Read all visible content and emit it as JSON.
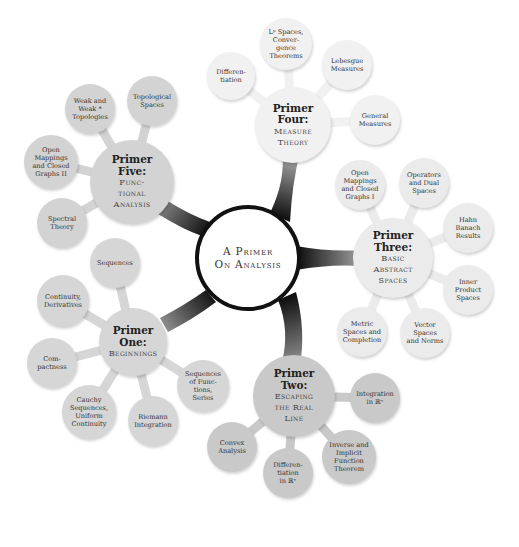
{
  "center": {
    "lines": [
      "A Primer",
      "On Analysis"
    ]
  },
  "primers": [
    {
      "id": "four",
      "title_lines": [
        "Primer",
        "Four:"
      ],
      "subtitle_lines": [
        "Measure",
        "Theory"
      ],
      "color": "#f1f1f1",
      "leaves": [
        {
          "lines": [
            "Differen-",
            "tiation"
          ]
        },
        {
          "lines": [
            "Lᵖ Spaces,",
            "Conver-",
            "gence",
            "Theorems"
          ]
        },
        {
          "lines": [
            "Lebesgue",
            "Measures"
          ]
        },
        {
          "lines": [
            "General",
            "Measures"
          ]
        }
      ]
    },
    {
      "id": "three",
      "title_lines": [
        "Primer",
        "Three:"
      ],
      "subtitle_lines": [
        "Basic",
        "Abstract",
        "Spaces"
      ],
      "color": "#ebebeb",
      "leaves": [
        {
          "lines": [
            "Open",
            "Mappings",
            "and Closed",
            "Graphs I"
          ]
        },
        {
          "lines": [
            "Operators",
            "and Dual",
            "Spaces"
          ]
        },
        {
          "lines": [
            "Hahn",
            "Banach",
            "Results"
          ]
        },
        {
          "lines": [
            "Inner",
            "Product",
            "Spaces"
          ]
        },
        {
          "lines": [
            "Vector",
            "Spaces",
            "and Norms"
          ]
        },
        {
          "lines": [
            "Metric",
            "Spaces and",
            "Completion"
          ]
        }
      ]
    },
    {
      "id": "two",
      "title_lines": [
        "Primer",
        "Two:"
      ],
      "subtitle_lines": [
        "Escaping",
        "the Real",
        "Line"
      ],
      "color": "#c9c9c9",
      "leaves": [
        {
          "lines": [
            "Integration",
            "in ℝⁿ"
          ]
        },
        {
          "lines": [
            "Inverse and",
            "Implicit",
            "Function",
            "Theorem"
          ]
        },
        {
          "lines": [
            "Differen-",
            "tiation",
            "in ℝⁿ"
          ]
        },
        {
          "lines": [
            "Convex",
            "Analysis"
          ]
        }
      ]
    },
    {
      "id": "one",
      "title_lines": [
        "Primer",
        "One:"
      ],
      "subtitle_lines": [
        "Beginnings"
      ],
      "color": "#d6d6d6",
      "leaves": [
        {
          "lines": [
            "Sequences"
          ]
        },
        {
          "lines": [
            "Continuity,",
            "Derivatives"
          ]
        },
        {
          "lines": [
            "Com-",
            "pactness"
          ]
        },
        {
          "lines": [
            "Cauchy",
            "Sequences,",
            "Uniform",
            "Continuity"
          ]
        },
        {
          "lines": [
            "Riemann",
            "Integration"
          ]
        },
        {
          "lines": [
            "Sequences",
            "of Func-",
            "tions,",
            "Series"
          ]
        }
      ]
    },
    {
      "id": "five",
      "title_lines": [
        "Primer",
        "Five:"
      ],
      "subtitle_lines": [
        "Func-",
        "tional",
        "Analysis"
      ],
      "color": "#d3d3d3",
      "leaves": [
        {
          "lines": [
            "Weak and",
            "Weak *",
            "Topologies"
          ]
        },
        {
          "lines": [
            "Topological",
            "Spaces"
          ]
        },
        {
          "lines": [
            "Open",
            "Mappings",
            "and Closed",
            "Graphs II"
          ]
        },
        {
          "lines": [
            "Spectral",
            "Theory"
          ]
        }
      ]
    }
  ]
}
